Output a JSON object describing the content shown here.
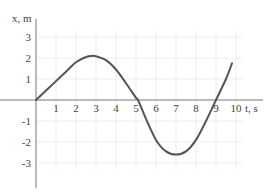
{
  "chart_data": {
    "type": "line",
    "title": "",
    "xlabel": "t, s",
    "ylabel": "x, m",
    "x_ticks": [
      "1",
      "2",
      "3",
      "4",
      "5",
      "6",
      "7",
      "8",
      "9",
      "10"
    ],
    "y_ticks": [
      "3",
      "2",
      "1",
      "-1",
      "-2",
      "-3"
    ],
    "xlim": [
      0,
      10.5
    ],
    "ylim": [
      -3.5,
      3.3
    ],
    "grid": true,
    "legend": null,
    "series": [
      {
        "name": "x(t)",
        "x": [
          0,
          0.5,
          1,
          1.5,
          2,
          2.5,
          2.8,
          3,
          3.5,
          4,
          4.5,
          5,
          5.1,
          5.5,
          6,
          6.5,
          7,
          7.5,
          8,
          8.5,
          9,
          9.5,
          9.8
        ],
        "y": [
          0,
          0.45,
          0.9,
          1.35,
          1.8,
          2.05,
          2.1,
          2.08,
          1.9,
          1.45,
          0.8,
          0.1,
          0,
          -0.9,
          -1.9,
          -2.45,
          -2.6,
          -2.45,
          -1.9,
          -1.0,
          0,
          1.0,
          1.75
        ]
      }
    ],
    "colors": {
      "curve": "#555555",
      "axis": "#777777",
      "grid": "#e6e6e6"
    }
  }
}
